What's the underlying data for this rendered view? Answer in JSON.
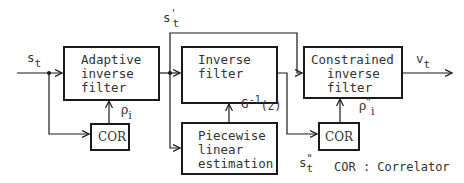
{
  "diagram": {
    "blocks": {
      "adaptive_filter": {
        "line1": "Adaptive",
        "line2": "inverse",
        "line3": "filter"
      },
      "inverse_filter": {
        "line1": "Inverse",
        "line2": "filter",
        "formula_base": "G",
        "formula_exp": "-1",
        "formula_arg": "(z)"
      },
      "piecewise": {
        "line1": "Piecewise",
        "line2": "linear",
        "line3": "estimation"
      },
      "constrained_filter": {
        "line1": "Constrained",
        "line2": "inverse",
        "line3": "filter"
      },
      "cor1": {
        "label": "COR"
      },
      "cor2": {
        "label": "COR"
      }
    },
    "signals": {
      "input": {
        "base": "s",
        "sub": "t"
      },
      "intermediate": {
        "base": "s",
        "sup": "'",
        "sub": "t"
      },
      "inverse_out": {
        "base": "s",
        "sup": "\"",
        "sub": "t"
      },
      "output": {
        "base": "v",
        "sub": "t"
      },
      "rho1": {
        "base": "ρ",
        "sub": "i"
      },
      "rho2": {
        "base": "ρ",
        "sup": "\"",
        "sub": "i"
      }
    },
    "legend": {
      "text": "COR : Correlator"
    },
    "colors": {
      "line": "#1a1a1a",
      "background": "#ffffff"
    }
  }
}
